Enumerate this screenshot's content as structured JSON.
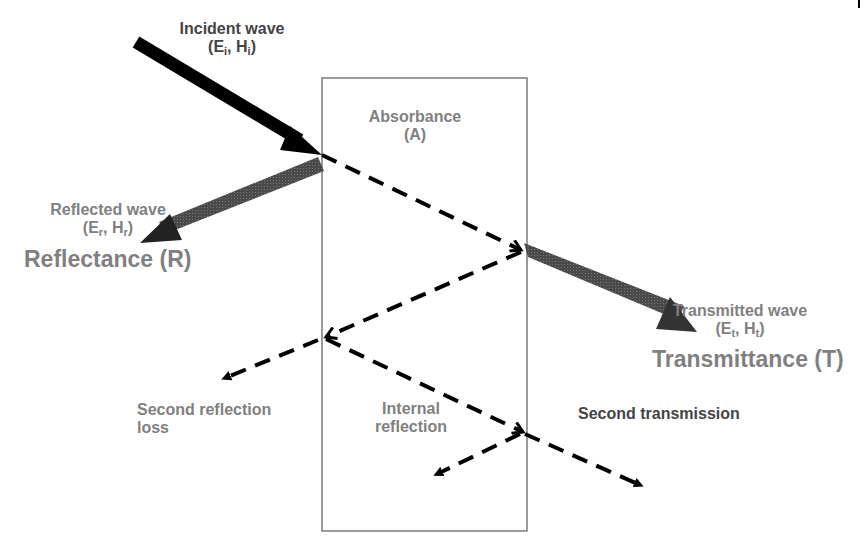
{
  "diagram": {
    "title_labels": {
      "incident": {
        "line1": "Incident wave",
        "sym_e": "E",
        "sub_e": "i",
        "sym_h": "H",
        "sub_h": "i"
      },
      "reflected": {
        "line1": "Reflected wave",
        "sym_e": "E",
        "sub_e": "r",
        "sym_h": "H",
        "sub_h": "r",
        "big": "Reflectance (R)"
      },
      "absorbance": {
        "line1": "Absorbance",
        "line2": "(A)"
      },
      "transmitted": {
        "line1": "Transmitted wave",
        "sym_e": "E",
        "sub_e": "t",
        "sym_h": "H",
        "sub_h": "t",
        "big": "Transmittance (T)"
      },
      "second_reflection": {
        "line1": "Second reflection",
        "line2": "loss"
      },
      "internal_reflection": {
        "line1": "Internal",
        "line2": "reflection"
      },
      "second_transmission": {
        "line1": "Second transmission"
      }
    },
    "colors": {
      "incident_arrow": "#000000",
      "reflected_arrow": "#3a3a3a",
      "transmitted_arrow": "#555555",
      "dashed": "#000000",
      "box_border": "#666666",
      "label_text": "#808080"
    },
    "shield_box": {
      "x": 322,
      "y": 78,
      "width": 205,
      "height": 453
    }
  }
}
